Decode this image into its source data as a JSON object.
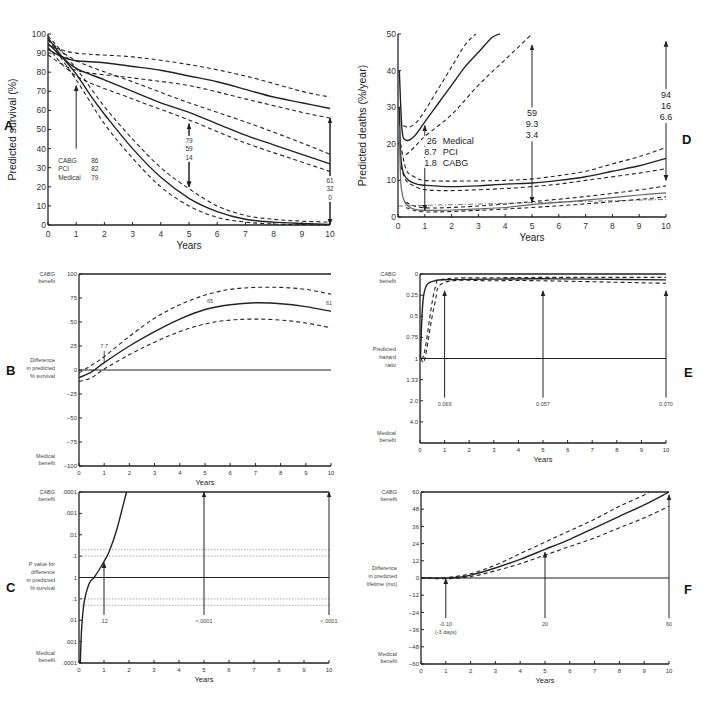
{
  "figure": {
    "caption_visible": false
  },
  "chart_data": [
    {
      "panel": "A",
      "type": "line",
      "title": "",
      "xlabel": "Years",
      "ylabel": "Predicted survival (%)",
      "xlim": [
        0,
        10
      ],
      "ylim": [
        0,
        100
      ],
      "xticks": [
        0,
        1,
        2,
        3,
        4,
        5,
        6,
        7,
        8,
        9,
        10
      ],
      "yticks": [
        0,
        10,
        20,
        30,
        40,
        50,
        60,
        70,
        80,
        90,
        100
      ],
      "grid": false,
      "series": [
        {
          "name": "CABG",
          "style": "solid",
          "x": [
            0,
            0.5,
            1,
            2,
            3,
            4,
            5,
            6,
            7,
            8,
            9,
            10
          ],
          "y": [
            92,
            88,
            86,
            85,
            83,
            81,
            78,
            75,
            71,
            67,
            64,
            61
          ]
        },
        {
          "name": "CABG upper CI",
          "style": "dashed",
          "x": [
            0,
            1,
            3,
            5,
            7,
            9,
            10
          ],
          "y": [
            94,
            90,
            88,
            84,
            78,
            70,
            67
          ]
        },
        {
          "name": "CABG lower CI",
          "style": "dashed",
          "x": [
            0,
            1,
            3,
            5,
            7,
            9,
            10
          ],
          "y": [
            89,
            81,
            77,
            73,
            66,
            59,
            56
          ]
        },
        {
          "name": "PCI",
          "style": "solid",
          "x": [
            0,
            0.5,
            1,
            2,
            3,
            4,
            5,
            6,
            7,
            8,
            9,
            10
          ],
          "y": [
            95,
            88,
            82,
            76,
            70,
            64,
            59,
            53,
            47,
            42,
            37,
            32
          ]
        },
        {
          "name": "PCI upper CI",
          "style": "dashed",
          "x": [
            0,
            1,
            3,
            5,
            7,
            9,
            10
          ],
          "y": [
            97,
            86,
            75,
            64,
            54,
            43,
            37
          ]
        },
        {
          "name": "PCI lower CI",
          "style": "dashed",
          "x": [
            0,
            1,
            3,
            5,
            7,
            9,
            10
          ],
          "y": [
            93,
            78,
            66,
            55,
            43,
            33,
            28
          ]
        },
        {
          "name": "Medical",
          "style": "solid",
          "x": [
            0,
            0.5,
            1,
            1.5,
            2,
            3,
            4,
            5,
            6,
            7,
            8,
            9,
            10
          ],
          "y": [
            98,
            88,
            79,
            68,
            58,
            40,
            25,
            14,
            7,
            3,
            1.5,
            0.8,
            0.3
          ]
        },
        {
          "name": "Medical upper CI",
          "style": "dashed",
          "x": [
            0,
            1,
            2,
            3,
            4,
            5,
            6,
            7,
            8,
            9,
            10
          ],
          "y": [
            99,
            82,
            62,
            45,
            30,
            19,
            10,
            5,
            3,
            2,
            1.5
          ]
        },
        {
          "name": "Medical lower CI",
          "style": "dashed",
          "x": [
            0,
            1,
            2,
            3,
            4,
            5,
            6,
            7,
            8,
            9,
            10
          ],
          "y": [
            97,
            76,
            53,
            35,
            20,
            10,
            4,
            1.5,
            0.5,
            0.2,
            0
          ]
        }
      ],
      "annotations": [
        {
          "x": 1,
          "arrow_from": 40,
          "arrow_to": 73,
          "labels": [
            [
              "CABG",
              "86"
            ],
            [
              "PCI",
              "82"
            ],
            [
              "Medical",
              "79"
            ]
          ]
        },
        {
          "x": 5,
          "arrow_from": 53,
          "arrow_to": 20,
          "labels": [
            "79",
            "59",
            "14"
          ]
        },
        {
          "x": 10,
          "arrow_from": 56,
          "arrow_to": 0.5,
          "labels": [
            "61",
            "32",
            "0"
          ]
        }
      ],
      "panel_label": "A"
    },
    {
      "panel": "B",
      "type": "line",
      "xlabel": "Years",
      "ylabel": "Difference in predicted % survival",
      "ylabel_top": "CABG benefit",
      "ylabel_bottom": "Medical benefit",
      "xlim": [
        0,
        10
      ],
      "ylim": [
        -100,
        100
      ],
      "xticks": [
        0,
        1,
        2,
        3,
        4,
        5,
        6,
        7,
        8,
        9,
        10
      ],
      "yticks": [
        -100,
        -75,
        -50,
        -25,
        0,
        25,
        50,
        75,
        100
      ],
      "grid": false,
      "series": [
        {
          "name": "Difference",
          "style": "solid",
          "x": [
            0,
            0.5,
            1,
            2,
            3,
            4,
            5,
            6,
            7,
            8,
            9,
            10
          ],
          "y": [
            -8,
            -2,
            7.7,
            25,
            40,
            53,
            63,
            68,
            70,
            69,
            66,
            61
          ]
        },
        {
          "name": "Upper CI",
          "style": "dashed",
          "x": [
            0,
            0.5,
            1,
            2,
            3,
            4,
            5,
            6,
            7,
            8,
            9,
            10
          ],
          "y": [
            -3,
            5,
            14,
            35,
            54,
            68,
            78,
            84,
            86,
            86,
            84,
            79
          ]
        },
        {
          "name": "Lower CI",
          "style": "dashed",
          "x": [
            0,
            0.5,
            1,
            2,
            3,
            4,
            5,
            6,
            7,
            8,
            9,
            10
          ],
          "y": [
            -12,
            -8,
            1,
            16,
            29,
            40,
            48,
            52,
            53,
            52,
            49,
            44
          ]
        }
      ],
      "annotations": [
        {
          "x": 1,
          "label": "7.7"
        },
        {
          "x": 5,
          "label": "65"
        },
        {
          "x": 10,
          "label": "61"
        }
      ],
      "panel_label": "B"
    },
    {
      "panel": "C",
      "type": "line",
      "xlabel": "Years",
      "ylabel": "P value for difference in predicted % survival",
      "ylabel_top": "CABG benefit",
      "ylabel_bottom": "Medical benefit",
      "xlim": [
        0,
        10
      ],
      "ytick_labels": [
        ".0001",
        ".001",
        ".01",
        ".1",
        "1",
        ".1",
        ".01",
        ".001",
        ".0001"
      ],
      "grid": false,
      "reference_lines": [
        ".05 dotted",
        ".1 dotted"
      ],
      "series": [
        {
          "name": "P value",
          "style": "solid",
          "x": [
            0.05,
            0.1,
            0.2,
            0.4,
            0.6,
            0.8,
            1.0,
            1.2,
            1.5,
            1.9
          ],
          "y_pos": [
            -4,
            -2.5,
            -1.2,
            -0.3,
            0,
            0.35,
            0.75,
            1.2,
            2.2,
            4
          ]
        }
      ],
      "annotations": [
        {
          "x": 1,
          "label": ".12"
        },
        {
          "x": 5,
          "label": "<.0001"
        },
        {
          "x": 10,
          "label": "<.0001"
        }
      ],
      "panel_label": "C"
    },
    {
      "panel": "D",
      "type": "line",
      "xlabel": "Years",
      "ylabel": "Predicted deaths (%/year)",
      "xlim": [
        0,
        10
      ],
      "ylim": [
        0,
        50
      ],
      "xticks": [
        0,
        1,
        2,
        3,
        4,
        5,
        6,
        7,
        8,
        9,
        10
      ],
      "yticks": [
        0,
        10,
        20,
        30,
        40,
        50
      ],
      "grid": false,
      "series": [
        {
          "name": "Medical",
          "style": "solid",
          "x": [
            0.05,
            0.15,
            0.3,
            0.6,
            1,
            1.5,
            2,
            2.5,
            3,
            3.5,
            3.8
          ],
          "y": [
            40,
            24,
            21,
            22,
            26,
            31,
            36,
            41,
            45,
            49,
            50
          ]
        },
        {
          "name": "Medical upper CI",
          "style": "dashed",
          "x": [
            0.2,
            0.4,
            0.7,
            1,
            1.5,
            2,
            2.5,
            2.9
          ],
          "y": [
            25,
            24.5,
            26,
            29,
            35,
            41,
            47,
            50
          ]
        },
        {
          "name": "Medical lower CI",
          "style": "dashed",
          "x": [
            0.3,
            0.6,
            1,
            2,
            3,
            4,
            5
          ],
          "y": [
            17,
            19,
            22,
            28,
            36,
            43,
            50
          ]
        },
        {
          "name": "PCI",
          "style": "solid",
          "x": [
            0.05,
            0.1,
            0.2,
            0.4,
            0.7,
            1,
            2,
            3,
            4,
            5,
            6,
            7,
            8,
            9,
            10
          ],
          "y": [
            30,
            17,
            12,
            10,
            9,
            8.7,
            8.3,
            8.5,
            9,
            9.3,
            10,
            11,
            12.5,
            14,
            16
          ]
        },
        {
          "name": "PCI upper CI",
          "style": "dashed",
          "x": [
            0.1,
            0.3,
            0.6,
            1,
            2,
            4,
            5,
            6,
            7,
            8,
            9,
            10
          ],
          "y": [
            20,
            13,
            11,
            10,
            9.8,
            10,
            10.4,
            11.3,
            12.5,
            14.5,
            16.5,
            19
          ]
        },
        {
          "name": "PCI lower CI",
          "style": "dashed",
          "x": [
            0.1,
            0.3,
            0.6,
            1,
            2,
            4,
            5,
            6,
            7,
            8,
            9,
            10
          ],
          "y": [
            14,
            10,
            8.5,
            7.5,
            7.2,
            7.8,
            8.3,
            9,
            10,
            11,
            12,
            13.2
          ]
        },
        {
          "name": "CABG",
          "style": "solid-gray",
          "x": [
            0.05,
            0.1,
            0.2,
            0.4,
            0.7,
            1,
            2,
            3,
            4,
            5,
            6,
            7,
            8,
            9,
            10
          ],
          "y": [
            25,
            10,
            5,
            2.8,
            2,
            1.8,
            1.9,
            2.2,
            2.6,
            3.4,
            4,
            4.6,
            5.3,
            6,
            6.6
          ]
        },
        {
          "name": "CABG upper CI",
          "style": "dashed",
          "x": [
            0.3,
            1,
            3,
            5,
            7,
            9,
            10
          ],
          "y": [
            4,
            2.5,
            3,
            4.2,
            5.6,
            7.4,
            8.5
          ]
        },
        {
          "name": "CABG lower CI",
          "style": "dashed",
          "x": [
            0.3,
            1,
            3,
            5,
            7,
            9,
            10
          ],
          "y": [
            2.5,
            1.4,
            1.8,
            2.6,
            3.6,
            4.8,
            5.5
          ]
        }
      ],
      "annotations": [
        {
          "x": 1,
          "labels": [
            [
              "26",
              "Medical"
            ],
            [
              "8.7",
              "PCI"
            ],
            [
              "1.8",
              "CABG"
            ]
          ]
        },
        {
          "x": 5,
          "labels": [
            "59",
            "9.3",
            "3.4"
          ]
        },
        {
          "x": 10,
          "labels": [
            "94",
            "16",
            "6.6"
          ]
        }
      ],
      "panel_label": "D"
    },
    {
      "panel": "E",
      "type": "line",
      "xlabel": "Years",
      "ylabel": "Predicted hazard ratio",
      "ylabel_top": "CABG benefit",
      "ylabel_bottom": "Medical benefit",
      "xlim": [
        0,
        10
      ],
      "ytick_labels": [
        "0",
        "0.25",
        "0.5",
        "0.75",
        "1",
        "1.33",
        "2.0",
        "4.0"
      ],
      "grid": false,
      "series": [
        {
          "name": "Hazard ratio",
          "style": "solid",
          "x": [
            0.02,
            0.08,
            0.15,
            0.3,
            0.6,
            1,
            3,
            5,
            7,
            10
          ],
          "y": [
            1.0,
            0.5,
            0.25,
            0.12,
            0.08,
            0.069,
            0.06,
            0.057,
            0.06,
            0.07
          ]
        }
      ],
      "annotations": [
        {
          "x": 1,
          "label": "0.069"
        },
        {
          "x": 5,
          "label": "0.057"
        },
        {
          "x": 10,
          "label": "0.070"
        }
      ],
      "panel_label": "E"
    },
    {
      "panel": "F",
      "type": "line",
      "xlabel": "Years",
      "ylabel": "Difference in predicted lifetime (mo)",
      "ylabel_top": "CABG benefit",
      "ylabel_bottom": "Medical benefit",
      "xlim": [
        0,
        10
      ],
      "ylim": [
        -60,
        60
      ],
      "xticks": [
        0,
        1,
        2,
        3,
        4,
        5,
        6,
        7,
        8,
        9,
        10
      ],
      "yticks": [
        -60,
        -48,
        -36,
        -24,
        -12,
        0,
        12,
        24,
        36,
        48,
        60
      ],
      "grid": false,
      "series": [
        {
          "name": "Difference",
          "style": "solid",
          "x": [
            0,
            1,
            1.5,
            2,
            3,
            4,
            5,
            6,
            7,
            8,
            9,
            10
          ],
          "y": [
            0,
            -0.1,
            0.5,
            2,
            7,
            13,
            20,
            27,
            35,
            43,
            51,
            60
          ]
        },
        {
          "name": "Upper CI",
          "style": "dashed",
          "x": [
            0,
            1,
            2,
            3,
            4,
            5,
            6,
            7,
            8,
            9,
            9.2
          ],
          "y": [
            0,
            0.3,
            3,
            9,
            17,
            25,
            33,
            41,
            50,
            58,
            60
          ]
        },
        {
          "name": "Lower CI",
          "style": "dashed",
          "x": [
            0,
            1,
            2,
            3,
            4,
            5,
            6,
            7,
            8,
            9,
            10
          ],
          "y": [
            0,
            -0.5,
            1,
            5,
            10,
            16,
            22,
            28,
            35,
            42,
            50
          ]
        }
      ],
      "annotations": [
        {
          "x": 1,
          "label": "-0.10",
          "sublabel": "(-3 days)"
        },
        {
          "x": 5,
          "label": "20"
        },
        {
          "x": 10,
          "label": "60"
        }
      ],
      "panel_label": "F"
    }
  ]
}
